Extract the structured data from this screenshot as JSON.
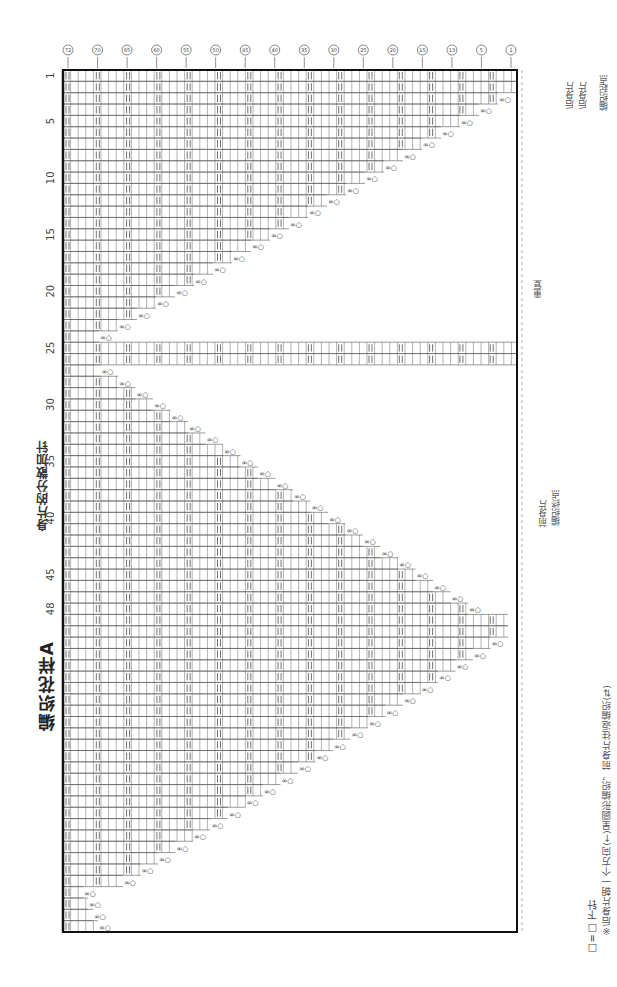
{
  "title": "编织花样A",
  "subtitle": "身片的分散加针",
  "center_mark": "○",
  "row_numbers": [
    "1",
    "5",
    "10",
    "15",
    "20",
    "25",
    "30",
    "35",
    "40",
    "45",
    "48"
  ],
  "circled_stitch_markers": [
    "72",
    "70",
    "65",
    "60",
    "55",
    "50",
    "45",
    "40",
    "35",
    "30",
    "25",
    "20",
    "15",
    "13",
    "5",
    "1"
  ],
  "right_labels": {
    "back_start_top": "后身片",
    "back_start_bottom": "后身片",
    "start_bracket": "编织起点",
    "repeat": "重复",
    "front_end": "前身片",
    "front_end_sub": "编织终点"
  },
  "legend": {
    "symbol_knit": "□=□ 下针",
    "note": "※后身片朝一个方向(←)呈圆形编织，前身片往返编织(⇄)"
  },
  "colors": {
    "grid_line": "#555555",
    "border": "#111111",
    "dashed": "#999999"
  }
}
